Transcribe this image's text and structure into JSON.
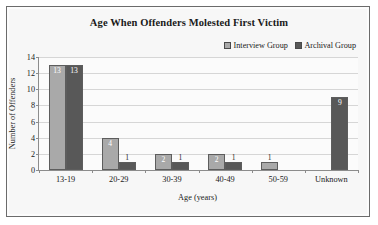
{
  "chart_data": {
    "type": "bar",
    "title": "Age When Offenders Molested First Victim",
    "xlabel": "Age (years)",
    "ylabel": "Number of Offenders",
    "categories": [
      "13-19",
      "20-29",
      "30-39",
      "40-49",
      "50-59",
      "Unknown"
    ],
    "series": [
      {
        "name": "Interview Group",
        "color": "#a9a9a9",
        "values": [
          13,
          4,
          2,
          2,
          1,
          0
        ]
      },
      {
        "name": "Archival Group",
        "color": "#585858",
        "values": [
          13,
          1,
          1,
          1,
          0,
          9
        ]
      }
    ],
    "ylim": [
      0,
      14
    ],
    "yticks": [
      0,
      2,
      4,
      6,
      8,
      10,
      12,
      14
    ],
    "ytick_labels": [
      "0",
      "2",
      "4",
      "6",
      "8",
      "10",
      "12",
      "14"
    ],
    "grid": "horizontal",
    "legend_position": "top-right",
    "data_labels": true
  },
  "legend": {
    "items": [
      {
        "label": "Interview Group",
        "swatch": "#a9a9a9"
      },
      {
        "label": "Archival Group",
        "swatch": "#585858"
      }
    ]
  }
}
